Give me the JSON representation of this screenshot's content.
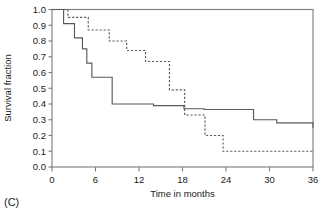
{
  "figure": {
    "panel_label": "(C)"
  },
  "chart_data": {
    "type": "line",
    "title": "",
    "subtitle": "",
    "xlabel": "Time in months",
    "ylabel": "Survival fraction",
    "xlim": [
      0,
      36
    ],
    "ylim": [
      0.0,
      1.0
    ],
    "xticks": [
      0,
      6,
      12,
      18,
      24,
      30,
      36
    ],
    "xticklabels": [
      "0",
      "6",
      "12",
      "18",
      "24",
      "30",
      "36"
    ],
    "yticks": [
      0.0,
      0.1,
      0.2,
      0.3,
      0.4,
      0.5,
      0.6,
      0.7,
      0.8,
      0.9,
      1.0
    ],
    "yticklabels": [
      "0.0",
      "0.1",
      "0.2",
      "0.3",
      "0.4",
      "0.5",
      "0.6",
      "0.7",
      "0.8",
      "0.9",
      "1.0"
    ],
    "grid": false,
    "legend": null,
    "legend_position": "none",
    "step_style": "post",
    "series": [
      {
        "name": "solid-curve",
        "style": "solid",
        "color": "#5a5a5a",
        "x": [
          0.0,
          1.1,
          1.6,
          2.6,
          3.1,
          3.6,
          4.2,
          4.8,
          5.5,
          8.1,
          8.3,
          13.4,
          14.0,
          18.2,
          20.7,
          21.0,
          27.2,
          27.8,
          31.0,
          36.0
        ],
        "y": [
          1.0,
          1.0,
          0.91,
          0.91,
          0.82,
          0.82,
          0.75,
          0.66,
          0.57,
          0.57,
          0.4,
          0.4,
          0.39,
          0.37,
          0.37,
          0.365,
          0.365,
          0.3,
          0.28,
          0.25
        ]
      },
      {
        "name": "dashed-curve",
        "style": "dashed",
        "color": "#5a5a5a",
        "x": [
          0.0,
          2.0,
          2.2,
          4.7,
          5.0,
          7.6,
          7.9,
          10.0,
          10.3,
          12.6,
          12.9,
          15.9,
          16.2,
          18.0,
          18.3,
          20.8,
          21.1,
          23.3,
          23.6,
          36.0
        ],
        "y": [
          1.0,
          1.0,
          0.95,
          0.95,
          0.87,
          0.87,
          0.8,
          0.8,
          0.74,
          0.74,
          0.67,
          0.67,
          0.49,
          0.49,
          0.33,
          0.33,
          0.2,
          0.2,
          0.1,
          0.1
        ]
      }
    ]
  }
}
